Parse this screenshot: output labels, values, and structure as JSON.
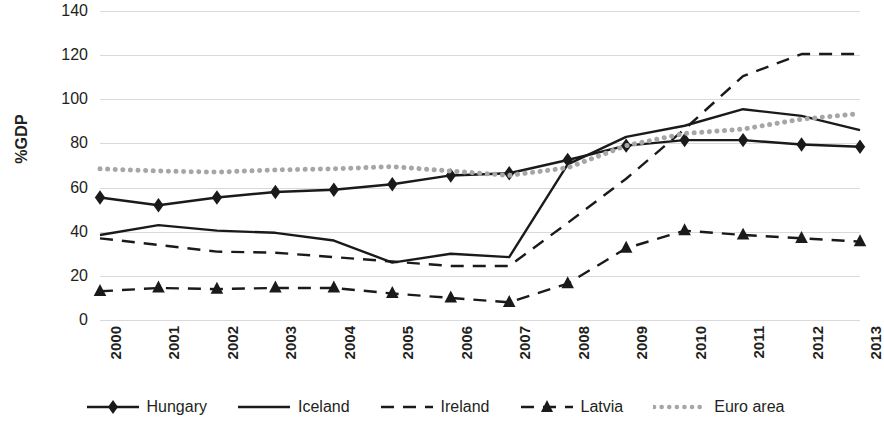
{
  "chart_data": {
    "type": "line",
    "title": "",
    "xlabel": "",
    "ylabel": "%GDP",
    "ylim": [
      0,
      140
    ],
    "ytick_step": 20,
    "yticks": [
      140,
      120,
      100,
      80,
      60,
      40,
      20,
      0
    ],
    "grid": true,
    "legend_position": "bottom",
    "categories": [
      "2000",
      "2001",
      "2002",
      "2003",
      "2004",
      "2005",
      "2006",
      "2007",
      "2008",
      "2009",
      "2010",
      "2011",
      "2012",
      "2013"
    ],
    "series": [
      {
        "name": "Hungary",
        "style": "solid",
        "marker": "diamond",
        "color": "#1a1a1a",
        "values": [
          55.5,
          52.0,
          55.5,
          58.0,
          59.0,
          61.5,
          65.5,
          66.5,
          72.5,
          79.0,
          81.5,
          81.5,
          79.5,
          78.5
        ]
      },
      {
        "name": "Iceland",
        "style": "solid",
        "marker": "none",
        "color": "#1a1a1a",
        "values": [
          38.5,
          43.0,
          40.5,
          39.5,
          36.0,
          26.0,
          30.0,
          28.5,
          70.5,
          83.0,
          88.0,
          95.5,
          92.5,
          86.0
        ]
      },
      {
        "name": "Ireland",
        "style": "dashed",
        "marker": "none",
        "color": "#1a1a1a",
        "values": [
          37.0,
          34.0,
          31.0,
          30.5,
          28.5,
          26.5,
          24.5,
          24.5,
          44.0,
          64.0,
          86.5,
          110.5,
          120.5,
          120.5
        ]
      },
      {
        "name": "Latvia",
        "style": "dashed",
        "marker": "triangle",
        "color": "#1a1a1a",
        "values": [
          13.0,
          14.5,
          14.0,
          14.5,
          14.5,
          12.0,
          10.0,
          8.0,
          16.5,
          32.5,
          40.5,
          38.5,
          37.0,
          35.5
        ]
      },
      {
        "name": "Euro area",
        "style": "dotted",
        "marker": "none",
        "color": "#a6a6a6",
        "values": [
          68.5,
          67.5,
          67.0,
          68.0,
          68.5,
          69.5,
          67.5,
          65.5,
          69.0,
          79.0,
          84.5,
          86.5,
          91.0,
          93.5
        ]
      }
    ]
  }
}
